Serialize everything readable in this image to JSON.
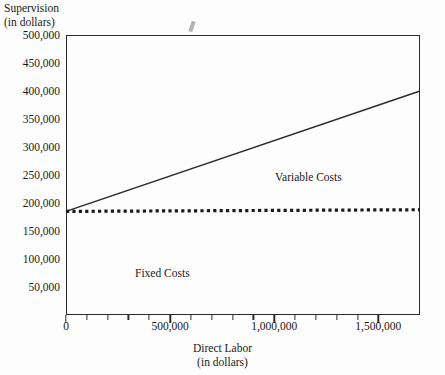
{
  "chart_data": {
    "type": "line",
    "title": "",
    "xlabel": "Direct Labor",
    "xlabel_sub": "(in dollars)",
    "ylabel": "Supervision",
    "ylabel_sub": "(in dollars)",
    "xlim": [
      0,
      1700000
    ],
    "ylim": [
      0,
      500000
    ],
    "grid": false,
    "legend": "none (inline annotations)",
    "x_ticks": [
      {
        "value": 0,
        "label": "0",
        "major": true
      },
      {
        "value": 100000,
        "label": "",
        "major": false
      },
      {
        "value": 200000,
        "label": "",
        "major": false
      },
      {
        "value": 300000,
        "label": "",
        "major": false
      },
      {
        "value": 400000,
        "label": "",
        "major": false
      },
      {
        "value": 500000,
        "label": "500,000",
        "major": true
      },
      {
        "value": 600000,
        "label": "",
        "major": false
      },
      {
        "value": 700000,
        "label": "",
        "major": false
      },
      {
        "value": 800000,
        "label": "",
        "major": false
      },
      {
        "value": 900000,
        "label": "",
        "major": false
      },
      {
        "value": 1000000,
        "label": "1,000,000",
        "major": true
      },
      {
        "value": 1100000,
        "label": "",
        "major": false
      },
      {
        "value": 1200000,
        "label": "",
        "major": false
      },
      {
        "value": 1300000,
        "label": "",
        "major": false
      },
      {
        "value": 1400000,
        "label": "",
        "major": false
      },
      {
        "value": 1500000,
        "label": "1,500,000",
        "major": true
      }
    ],
    "y_ticks": [
      {
        "value": 500000,
        "label": "500,000"
      },
      {
        "value": 450000,
        "label": "450,000"
      },
      {
        "value": 400000,
        "label": "400,000"
      },
      {
        "value": 350000,
        "label": "350,000"
      },
      {
        "value": 300000,
        "label": "300,000"
      },
      {
        "value": 250000,
        "label": "250,000"
      },
      {
        "value": 200000,
        "label": "200,000"
      },
      {
        "value": 150000,
        "label": "150,000"
      },
      {
        "value": 100000,
        "label": "100,000"
      },
      {
        "value": 50000,
        "label": "50,000"
      }
    ],
    "series": [
      {
        "name": "Variable Costs",
        "style": "solid",
        "color": "#2b2b2b",
        "points": [
          {
            "x": 0,
            "y": 185000
          },
          {
            "x": 1700000,
            "y": 400000
          }
        ]
      },
      {
        "name": "Fixed Costs",
        "style": "dotted",
        "color": "#1a1a1a",
        "points": [
          {
            "x": 0,
            "y": 185000
          },
          {
            "x": 1700000,
            "y": 188000
          }
        ]
      }
    ],
    "annotations": [
      {
        "text": "Variable Costs",
        "x": 1080000,
        "y": 255000
      },
      {
        "text": "Fixed Costs",
        "x": 410000,
        "y": 83000
      }
    ]
  },
  "axes": {
    "y_title_line1": "Supervision",
    "y_title_line2": "(in dollars)",
    "x_title_line1": "Direct Labor",
    "x_title_line2": "(in dollars)"
  },
  "annotations": {
    "variable_costs": "Variable Costs",
    "fixed_costs": "Fixed Costs"
  }
}
